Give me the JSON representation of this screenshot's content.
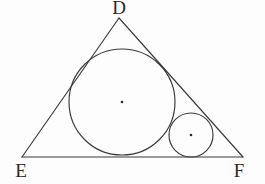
{
  "figure": {
    "kind": "geometry-diagram",
    "canvas": {
      "width": 265,
      "height": 184
    },
    "background_color": "#fdfdfd",
    "stroke_color": "#3a3a3a",
    "label_color": "#2b2b2b",
    "stroke_width": 1.15,
    "vertices": [
      {
        "name": "D",
        "label": "D",
        "x": 119,
        "y": 18,
        "label_x": 119,
        "label_y": 14
      },
      {
        "name": "E",
        "label": "E",
        "x": 22,
        "y": 157,
        "label_x": 21,
        "label_y": 177
      },
      {
        "name": "F",
        "label": "F",
        "x": 243,
        "y": 157,
        "label_x": 239,
        "label_y": 177
      }
    ],
    "edges": [
      {
        "name": "edge-DE",
        "from": "D",
        "to": "E"
      },
      {
        "name": "edge-DF",
        "from": "D",
        "to": "F"
      },
      {
        "name": "edge-EF",
        "from": "E",
        "to": "F"
      }
    ],
    "circles": [
      {
        "name": "incircle",
        "role": "inscribed-circle",
        "cx": 122,
        "cy": 102,
        "r": 53,
        "center_dot_r": 1.3
      },
      {
        "name": "small-circle",
        "role": "tangent-circle",
        "cx": 191,
        "cy": 135,
        "r": 22,
        "center_dot_r": 1.3
      }
    ]
  }
}
